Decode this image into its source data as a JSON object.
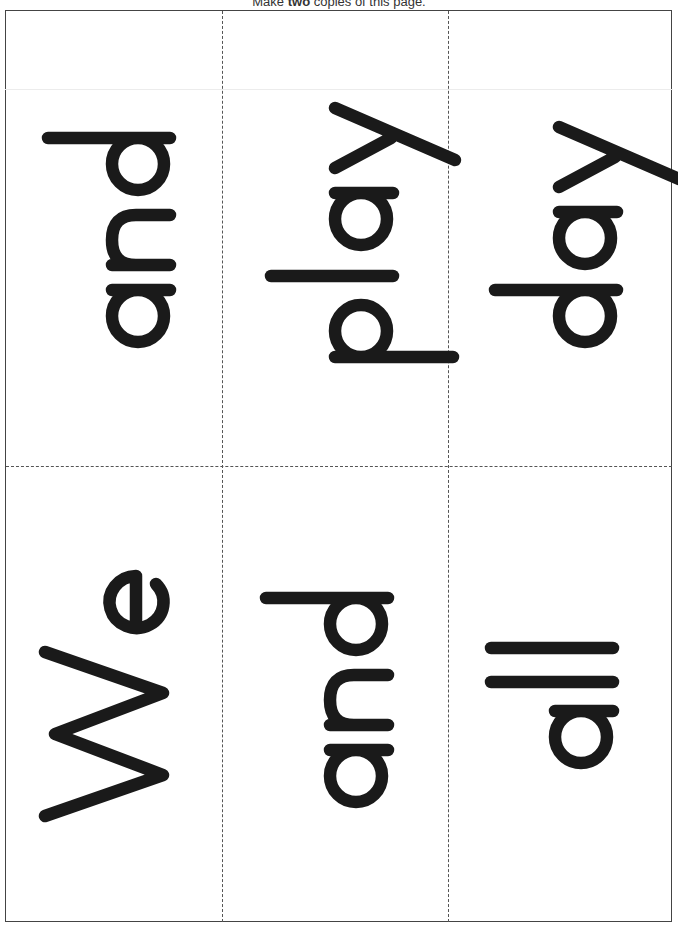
{
  "header": {
    "prefix": "Make",
    "emphasis": "two",
    "suffix": "copies of this page."
  },
  "cards": [
    {
      "word": "and",
      "row": 1,
      "col": 1
    },
    {
      "word": "play",
      "row": 1,
      "col": 2
    },
    {
      "word": "day",
      "row": 1,
      "col": 3
    },
    {
      "word": "We",
      "row": 2,
      "col": 1
    },
    {
      "word": "and",
      "row": 2,
      "col": 2
    },
    {
      "word": "all",
      "row": 2,
      "col": 3
    }
  ],
  "style": {
    "ink_color": "#1a1a1a",
    "border_color": "#444444",
    "cut_line_style": "dashed",
    "text_orientation": "rotated 90° counter-clockwise (reads bottom to top)"
  }
}
